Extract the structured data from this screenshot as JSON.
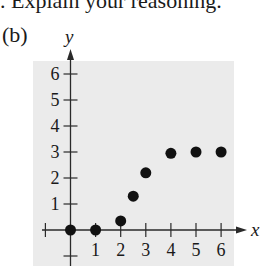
{
  "header_text": ". Explain your reasoning.",
  "part_label": "(b)",
  "chart_data": {
    "type": "scatter",
    "title": "",
    "xlabel": "x",
    "ylabel": "y",
    "xlim": [
      -1,
      6.5
    ],
    "ylim": [
      -1,
      6.5
    ],
    "x_ticks": [
      1,
      2,
      3,
      4,
      5,
      6
    ],
    "y_ticks": [
      1,
      2,
      3,
      4,
      5,
      6
    ],
    "grid": false,
    "background": "#ebebeb",
    "point_color": "#111111",
    "points": [
      {
        "x": 0,
        "y": 0
      },
      {
        "x": 1,
        "y": 0
      },
      {
        "x": 2,
        "y": 0.35
      },
      {
        "x": 2.5,
        "y": 1.3
      },
      {
        "x": 3,
        "y": 2.2
      },
      {
        "x": 4,
        "y": 2.95
      },
      {
        "x": 5,
        "y": 3.0
      },
      {
        "x": 6,
        "y": 3.0
      }
    ]
  }
}
